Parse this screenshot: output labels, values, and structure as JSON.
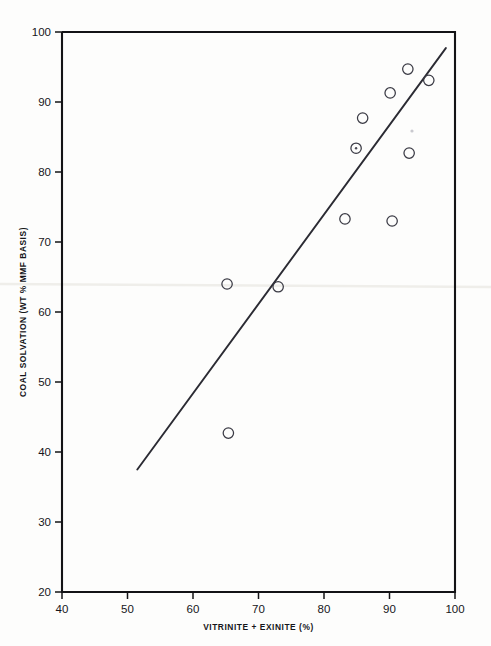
{
  "chart_data": {
    "type": "scatter",
    "title": "",
    "xlabel": "VITRINITE + EXINITE (%)",
    "ylabel": "COAL SOLVATION (WT % MMF BASIS)",
    "xlim": [
      40,
      100
    ],
    "ylim": [
      20,
      100
    ],
    "xticks": [
      40,
      50,
      60,
      70,
      80,
      90,
      100
    ],
    "yticks": [
      20,
      30,
      40,
      50,
      60,
      70,
      80,
      90,
      100
    ],
    "xtick_labels": [
      "40",
      "50",
      "60",
      "70",
      "80",
      "90",
      "100"
    ],
    "ytick_labels": [
      "20",
      "30",
      "40",
      "50",
      "60",
      "70",
      "80",
      "90",
      "100"
    ],
    "grid": false,
    "legend": null,
    "marker_style": "open-circle",
    "points": [
      {
        "x": 65.4,
        "y": 42.7
      },
      {
        "x": 65.2,
        "y": 64.0
      },
      {
        "x": 73.0,
        "y": 63.6
      },
      {
        "x": 83.2,
        "y": 73.3
      },
      {
        "x": 90.4,
        "y": 73.0
      },
      {
        "x": 84.9,
        "y": 83.4
      },
      {
        "x": 93.0,
        "y": 82.7
      },
      {
        "x": 85.9,
        "y": 87.7
      },
      {
        "x": 90.1,
        "y": 91.3
      },
      {
        "x": 92.8,
        "y": 94.7
      },
      {
        "x": 96.0,
        "y": 93.1
      }
    ],
    "series": [
      {
        "name": "coal samples",
        "type": "scatter",
        "values": [
          {
            "x": 65.4,
            "y": 42.7
          },
          {
            "x": 65.2,
            "y": 64.0
          },
          {
            "x": 73.0,
            "y": 63.6
          },
          {
            "x": 83.2,
            "y": 73.3
          },
          {
            "x": 90.4,
            "y": 73.0
          },
          {
            "x": 84.9,
            "y": 83.4
          },
          {
            "x": 93.0,
            "y": 82.7
          },
          {
            "x": 85.9,
            "y": 87.7
          },
          {
            "x": 90.1,
            "y": 91.3
          },
          {
            "x": 92.8,
            "y": 94.7
          },
          {
            "x": 96.0,
            "y": 93.1
          }
        ]
      },
      {
        "name": "regression line",
        "type": "line",
        "values": [
          {
            "x": 51.5,
            "y": 37.5
          },
          {
            "x": 98.6,
            "y": 97.7
          }
        ]
      }
    ],
    "colors": {
      "axis": "#131316",
      "marker": "#3a3a44",
      "trend": "#2b2b33",
      "background": "#ffffff"
    }
  }
}
